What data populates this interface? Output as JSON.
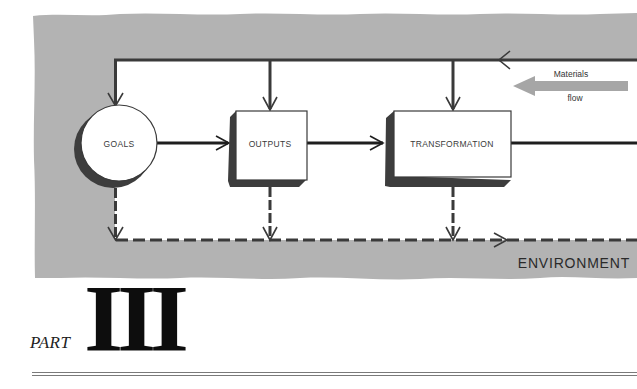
{
  "diagram": {
    "nodes": [
      {
        "id": "goals",
        "label": "GOALS",
        "shape": "circle"
      },
      {
        "id": "outputs",
        "label": "OUTPUTS",
        "shape": "box"
      },
      {
        "id": "transformation",
        "label": "TRANSFORMATION",
        "shape": "box"
      }
    ],
    "materials_flow": {
      "line1": "Materials",
      "line2": "flow"
    },
    "environment_label": "ENVIRONMENT",
    "edges": [
      {
        "from": "goals",
        "to": "outputs",
        "style": "solid"
      },
      {
        "from": "outputs",
        "to": "transformation",
        "style": "solid"
      },
      {
        "from": "transformation",
        "to": "right-edge",
        "style": "solid"
      },
      {
        "from": "right-edge",
        "to": "goals",
        "style": "solid",
        "note": "top feedback line"
      },
      {
        "from": "goals",
        "to": "environment",
        "style": "dashed"
      },
      {
        "from": "outputs",
        "to": "environment",
        "style": "dashed"
      },
      {
        "from": "transformation",
        "to": "environment",
        "style": "dashed"
      }
    ],
    "colors": {
      "environment_fill": "#b3b3b3",
      "line": "#333333",
      "shadow": "#3d3d3d",
      "materials_arrow": "#a6a6a6"
    }
  },
  "heading": {
    "part_word": "PART",
    "part_number": "III"
  }
}
